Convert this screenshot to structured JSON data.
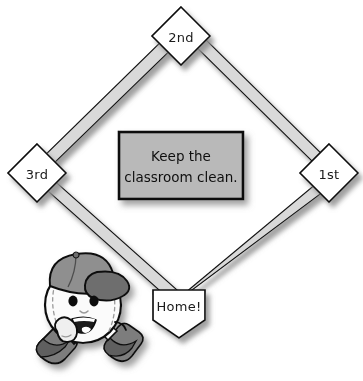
{
  "scene": {
    "title": "Baseball diamond classroom poster",
    "background_color": "#ffffff"
  },
  "colors": {
    "base_fill": "#ffffff",
    "base_stroke": "#111111",
    "path_fill": "#d9d9d9",
    "path_stroke": "#111111",
    "sign_fill": "#b9b9b9",
    "sign_stroke": "#0d0d0d",
    "shadow": "#9b9b9b",
    "ball_fill": "#fbfbfb",
    "ball_stroke": "#111111",
    "cap_fill": "#8f8f8f",
    "cap_dark": "#6e6e6e",
    "shoe_fill": "#7d7d7d",
    "shoe_dark": "#5f5f5f",
    "eye_fill": "#101010",
    "mouth_fill": "#1a1a1a",
    "tongue_fill": "#ffffff"
  },
  "bases": [
    {
      "id": "second-base",
      "label": "2nd",
      "cx": 181,
      "cy": 36,
      "half": 29
    },
    {
      "id": "third-base",
      "label": "3rd",
      "cx": 37,
      "cy": 173,
      "half": 29
    },
    {
      "id": "first-base",
      "label": "1st",
      "cx": 329,
      "cy": 173,
      "half": 29
    },
    {
      "id": "home-plate",
      "label": "Home!",
      "cx": 179,
      "cy": 310,
      "half": 27
    }
  ],
  "sign": {
    "name": "classroom-sign",
    "line1": "Keep the",
    "line2": "classroom clean.",
    "x": 119,
    "y": 132,
    "width": 124,
    "height": 67
  },
  "mascot": {
    "name": "baseball-mascot",
    "description": "smiling cartoon baseball wearing a cap, glove and shoes"
  }
}
